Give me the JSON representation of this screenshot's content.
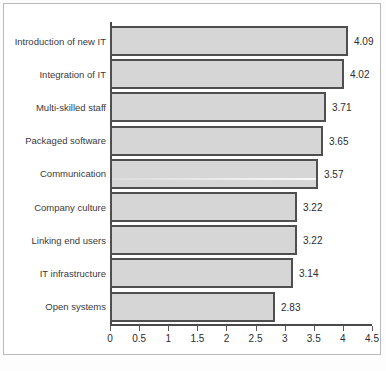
{
  "chart_data": {
    "type": "bar",
    "orientation": "horizontal",
    "title": "",
    "xlabel": "",
    "ylabel": "",
    "xlim": [
      0,
      4.5
    ],
    "grid": false,
    "legend": null,
    "categories": [
      "Introduction of new IT",
      "Integration of IT",
      "Multi-skilled staff",
      "Packaged software",
      "Communication",
      "Company culture",
      "Linking end users",
      "IT infrastructure",
      "Open systems"
    ],
    "values": [
      4.09,
      4.02,
      3.71,
      3.65,
      3.57,
      3.22,
      3.22,
      3.14,
      2.83
    ],
    "value_labels": [
      "4.09",
      "4.02",
      "3.71",
      "3.65",
      "3.57",
      "3.22",
      "3.22",
      "3.14",
      "2.83"
    ],
    "xticks": [
      0,
      0.5,
      1,
      1.5,
      2,
      2.5,
      3,
      3.5,
      4,
      4.5
    ],
    "xtick_labels": [
      "0",
      "0.5",
      "1",
      "1.5",
      "2",
      "2.5",
      "3",
      "3.5",
      "4",
      "4.5"
    ],
    "colors": {
      "bar_fill": "#d6d6d6",
      "bar_border": "#4f4f4f",
      "axis": "#4a4a4a",
      "text": "#2d2d2d",
      "category_text": "#3a3a3a",
      "frame": "#b9b9bc",
      "background": "#ffffff"
    }
  }
}
